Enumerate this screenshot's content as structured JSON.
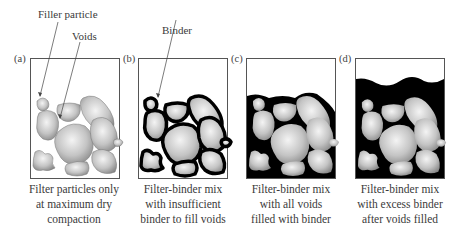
{
  "annotations": {
    "filler_particle": "Filler particle",
    "voids": "Voids",
    "binder": "Binder"
  },
  "panels": [
    {
      "letter": "(a)",
      "caption": [
        "Filter particles only",
        "at maximum dry",
        "compaction"
      ],
      "binder_level": "none"
    },
    {
      "letter": "(b)",
      "caption": [
        "Filter-binder mix",
        "with insufficient",
        "binder to fill voids"
      ],
      "binder_level": "coating"
    },
    {
      "letter": "(c)",
      "caption": [
        "Filter-binder mix",
        "with all voids",
        "filled with binder"
      ],
      "binder_level": "filled"
    },
    {
      "letter": "(d)",
      "caption": [
        "Filter-binder mix",
        "with excess binder",
        "after voids filled"
      ],
      "binder_level": "excess"
    }
  ],
  "colors": {
    "binder": "#000000",
    "particle_light": "#f2f2f2",
    "particle_dark": "#8a8a8a",
    "frame": "#555555"
  }
}
